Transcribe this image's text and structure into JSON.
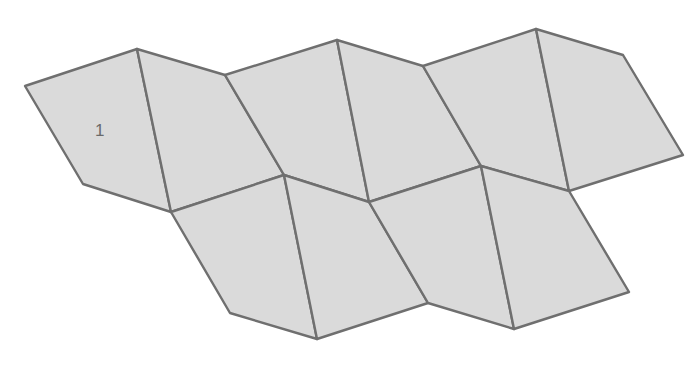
{
  "diagram": {
    "colors": {
      "fill": "#dadada",
      "stroke": "#6f6f6f",
      "label": "#6a6a6a"
    },
    "vertices": {
      "A": [
        25,
        86
      ],
      "B": [
        137,
        49
      ],
      "C": [
        225,
        75
      ],
      "D": [
        284,
        175
      ],
      "E": [
        83,
        184
      ],
      "F": [
        171,
        212
      ],
      "G": [
        337,
        40
      ],
      "H": [
        423,
        66
      ],
      "N": [
        369,
        202
      ],
      "I": [
        536,
        29
      ],
      "J": [
        623,
        55
      ],
      "K": [
        683,
        155
      ],
      "L": [
        569,
        191
      ],
      "M": [
        481,
        166
      ],
      "P": [
        230,
        313
      ],
      "Q": [
        317,
        339
      ],
      "R": [
        428,
        303
      ],
      "S": [
        514,
        329
      ],
      "T": [
        629,
        292
      ]
    },
    "faces": [
      {
        "id": "face-1",
        "label": "1",
        "points": "25,86 137,49 171,212 83,184"
      },
      {
        "id": "face-2",
        "points": "137,49 225,75 284,175 171,212"
      },
      {
        "id": "face-3",
        "points": "225,75 337,40 369,202 284,175"
      },
      {
        "id": "face-4",
        "points": "337,40 423,66 481,166 369,202"
      },
      {
        "id": "face-5",
        "points": "423,66 536,29 569,191 481,166"
      },
      {
        "id": "face-6",
        "points": "536,29 623,55 683,155 569,191"
      },
      {
        "id": "face-7",
        "points": "171,212 284,175 317,339 230,313"
      },
      {
        "id": "face-8",
        "points": "284,175 369,202 428,303 317,339"
      },
      {
        "id": "face-9",
        "points": "369,202 481,166 514,329 428,303"
      },
      {
        "id": "face-10",
        "points": "481,166 569,191 629,292 514,329"
      }
    ],
    "labels": [
      {
        "text": "1",
        "x": 95,
        "y": 136
      }
    ]
  }
}
